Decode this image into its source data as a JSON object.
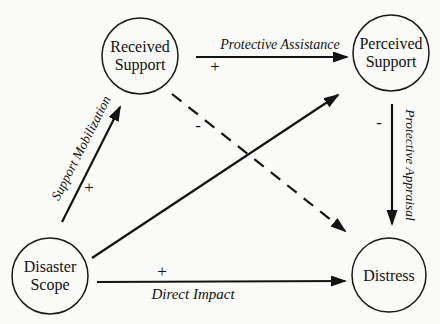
{
  "diagram": {
    "type": "path-model",
    "colors": {
      "ink": "#141414",
      "background": "#fbfbf9"
    },
    "nodes": {
      "received_support": {
        "line1": "Received",
        "line2": "Support"
      },
      "perceived_support": {
        "line1": "Perceived",
        "line2": "Support"
      },
      "disaster_scope": {
        "line1": "Disaster",
        "line2": "Scope"
      },
      "distress": {
        "line1": "Distress"
      }
    },
    "edges": {
      "protective_assistance": {
        "label": "Protective Assistance",
        "sign": "+",
        "from": "Received Support",
        "to": "Perceived Support",
        "style": "solid"
      },
      "support_mobilization": {
        "label": "Support Mobilization",
        "sign": "+",
        "from": "Disaster Scope",
        "to": "Received Support",
        "style": "solid"
      },
      "protective_appraisal": {
        "label": "Protective Appraisal",
        "sign": "-",
        "from": "Perceived Support",
        "to": "Distress",
        "style": "solid"
      },
      "direct_impact": {
        "label": "Direct Impact",
        "sign": "+",
        "from": "Disaster Scope",
        "to": "Distress",
        "style": "solid"
      },
      "received_support_to_distress": {
        "label": "",
        "sign": "-",
        "from": "Received Support",
        "to": "Distress",
        "style": "dashed"
      },
      "disaster_scope_to_perceived_support": {
        "label": "",
        "sign": "",
        "from": "Disaster Scope",
        "to": "Perceived Support",
        "style": "solid"
      }
    }
  }
}
